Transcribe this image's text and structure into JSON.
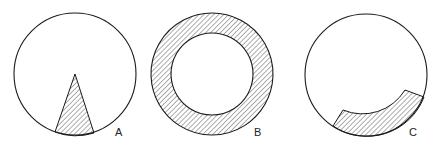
{
  "figures": [
    {
      "label": "A",
      "description": "Circle with hatched triangular wedge from center to bottom edge"
    },
    {
      "label": "B",
      "description": "Circle with hatched outer annular ring"
    },
    {
      "label": "C",
      "description": "Circle with hatched arc band along lower-right edge"
    }
  ],
  "colors": {
    "stroke": "#1a1a1a",
    "hatch": "#333333",
    "background": "#ffffff"
  }
}
